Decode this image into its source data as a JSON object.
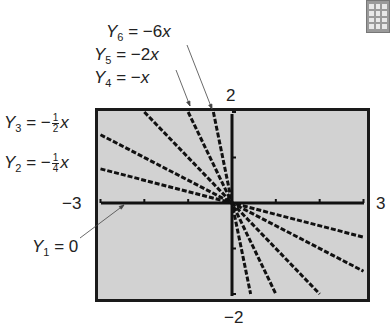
{
  "chart_data": {
    "type": "line",
    "title": "",
    "window": {
      "xmin": -3,
      "xmax": 3,
      "ymin": -2,
      "ymax": 2
    },
    "xlabel": "",
    "ylabel": "",
    "grid": false,
    "series": [
      {
        "name": "Y1 = 0",
        "slope": 0,
        "x": [
          -3,
          3
        ],
        "y": [
          0,
          0
        ]
      },
      {
        "name": "Y2 = -1/4 x",
        "slope": -0.25,
        "x": [
          -3,
          3
        ],
        "y": [
          0.75,
          -0.75
        ]
      },
      {
        "name": "Y3 = -1/2 x",
        "slope": -0.5,
        "x": [
          -3,
          3
        ],
        "y": [
          1.5,
          -1.5
        ]
      },
      {
        "name": "Y4 = -x",
        "slope": -1,
        "x": [
          -2,
          2
        ],
        "y": [
          2,
          -2
        ]
      },
      {
        "name": "Y5 = -2x",
        "slope": -2,
        "x": [
          -1,
          1
        ],
        "y": [
          2,
          -2
        ]
      },
      {
        "name": "Y6 = -6x",
        "slope": -6,
        "x": [
          -0.333,
          0.333
        ],
        "y": [
          2,
          -2
        ]
      }
    ],
    "axis_labels": {
      "left": "−3",
      "right": "3",
      "top": "2",
      "bottom": "−2"
    }
  },
  "labels": {
    "y6": {
      "name": "Y",
      "sub": "6",
      "rhs": "= −6",
      "var": "x"
    },
    "y5": {
      "name": "Y",
      "sub": "5",
      "rhs": "= −2",
      "var": "x"
    },
    "y4": {
      "name": "Y",
      "sub": "4",
      "rhs": "= −",
      "var": "x"
    },
    "y3": {
      "name": "Y",
      "sub": "3",
      "rhs": "= −",
      "num": "1",
      "den": "2",
      "var": "x"
    },
    "y2": {
      "name": "Y",
      "sub": "2",
      "rhs": "= −",
      "num": "1",
      "den": "4",
      "var": "x"
    },
    "y1": {
      "name": "Y",
      "sub": "1",
      "rhs": "= 0"
    }
  },
  "window_labels": {
    "xmin": "−3",
    "xmax": "3",
    "ymax": "2",
    "ymin": "−2"
  },
  "icon": "calculator-icon"
}
